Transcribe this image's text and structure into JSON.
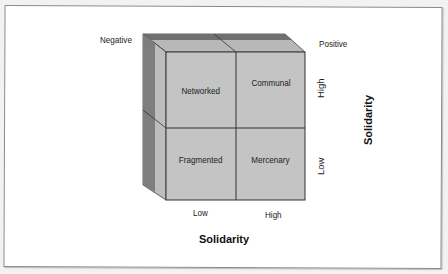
{
  "diagram": {
    "corner_labels": {
      "top_left": "Negative",
      "top_right": "Positive"
    },
    "quadrants": [
      {
        "label": "Networked",
        "row": "high",
        "col": "low"
      },
      {
        "label": "Communal",
        "row": "high",
        "col": "high"
      },
      {
        "label": "Fragmented",
        "row": "low",
        "col": "low"
      },
      {
        "label": "Mercenary",
        "row": "low",
        "col": "high"
      }
    ],
    "x_axis": {
      "title": "Solidarity",
      "ticks": [
        "Low",
        "High"
      ]
    },
    "y_axis": {
      "title": "Solidarity",
      "ticks": [
        "High",
        "Low"
      ]
    },
    "colors": {
      "front_face": "#c4c4c4",
      "side_dark": "#7e7e7e",
      "side_light": "#bdbdbd",
      "top_dark": "#6f6f6f",
      "top_light": "#b5b5b5",
      "lines": "#333333"
    }
  }
}
